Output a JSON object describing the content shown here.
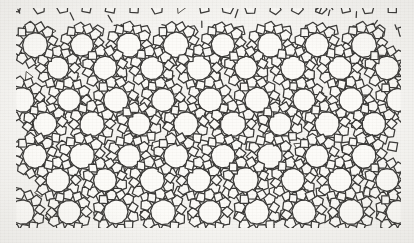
{
  "figure": {
    "title": "",
    "caption": "",
    "domain_label": "framework-tiling-diagram",
    "alt_text": "Periodic-looking network of large circular pores linked by pentagon and square tiles"
  },
  "canvas": {
    "width": 414,
    "height": 243,
    "background_color": "#f6f5f2",
    "paper_tone": "#f2f0ea"
  },
  "pattern_area": {
    "left": 16,
    "top": 8,
    "right": 401,
    "bottom": 228,
    "width": 385,
    "height": 220,
    "margin_top": 8,
    "margin_left": 16,
    "margin_right": 13,
    "margin_bottom": 15
  },
  "style": {
    "stroke_color": "#3b3a38",
    "stroke_color_light": "#56544f",
    "stroke_width": 1.25,
    "stroke_width_thin": 1.0,
    "fill_color": "#fbfaf7",
    "pore_fill": "#fcfbf8"
  },
  "geometry": {
    "lattice_type": "dodecagonal",
    "unit_cell_x": 47.0,
    "unit_cell_y": 46.0,
    "row_offset_x": 23.5,
    "columns": 9,
    "rows": 5,
    "pore_radius_large": 12.4,
    "pore_radius_small": 9.6,
    "pore_sides": 12,
    "ring_pentagon_radius": 6.1,
    "ring_square_half": 4.5,
    "connector_length": 8.4,
    "jitter_amplitude": 0.9,
    "jitter_seed": 20231
  },
  "tile_legend": [
    {
      "name": "twelve-ring-pore",
      "sides": 12,
      "count_approx": 58,
      "role": "large channel opening"
    },
    {
      "name": "pentagon-tile",
      "sides": 5,
      "count_approx": 240,
      "role": "ring linker"
    },
    {
      "name": "square-tile",
      "sides": 4,
      "count_approx": 180,
      "role": "bridge between pores"
    },
    {
      "name": "triangle-node",
      "sides": 3,
      "count_approx": 46,
      "role": "star junction"
    }
  ],
  "pore_grid": {
    "note": "Pore centre coordinates in pattern-area pixel space; r = outer radius.",
    "centers": [
      {
        "x": 35,
        "y": 45,
        "r": 12.6
      },
      {
        "x": 82,
        "y": 45,
        "r": 11.4
      },
      {
        "x": 129,
        "y": 45,
        "r": 12.2
      },
      {
        "x": 176,
        "y": 45,
        "r": 12.8
      },
      {
        "x": 223,
        "y": 45,
        "r": 11.8
      },
      {
        "x": 270,
        "y": 45,
        "r": 12.4
      },
      {
        "x": 317,
        "y": 45,
        "r": 12.0
      },
      {
        "x": 364,
        "y": 45,
        "r": 12.6
      },
      {
        "x": 58,
        "y": 68,
        "r": 11.2
      },
      {
        "x": 105,
        "y": 68,
        "r": 12.0
      },
      {
        "x": 152,
        "y": 68,
        "r": 11.6
      },
      {
        "x": 199,
        "y": 68,
        "r": 12.4
      },
      {
        "x": 246,
        "y": 68,
        "r": 11.4
      },
      {
        "x": 293,
        "y": 68,
        "r": 12.2
      },
      {
        "x": 340,
        "y": 68,
        "r": 11.8
      },
      {
        "x": 387,
        "y": 68,
        "r": 12.0
      },
      {
        "x": 22,
        "y": 100,
        "r": 12.4
      },
      {
        "x": 69,
        "y": 100,
        "r": 11.6
      },
      {
        "x": 116,
        "y": 100,
        "r": 12.6
      },
      {
        "x": 163,
        "y": 100,
        "r": 11.8
      },
      {
        "x": 210,
        "y": 100,
        "r": 12.2
      },
      {
        "x": 257,
        "y": 100,
        "r": 12.6
      },
      {
        "x": 304,
        "y": 100,
        "r": 11.4
      },
      {
        "x": 351,
        "y": 100,
        "r": 12.4
      },
      {
        "x": 398,
        "y": 100,
        "r": 11.8
      },
      {
        "x": 45,
        "y": 124,
        "r": 11.8
      },
      {
        "x": 92,
        "y": 124,
        "r": 12.4
      },
      {
        "x": 139,
        "y": 124,
        "r": 11.4
      },
      {
        "x": 186,
        "y": 124,
        "r": 12.2
      },
      {
        "x": 233,
        "y": 124,
        "r": 12.6
      },
      {
        "x": 280,
        "y": 124,
        "r": 11.6
      },
      {
        "x": 327,
        "y": 124,
        "r": 12.4
      },
      {
        "x": 374,
        "y": 124,
        "r": 12.0
      },
      {
        "x": 35,
        "y": 156,
        "r": 12.2
      },
      {
        "x": 82,
        "y": 156,
        "r": 12.6
      },
      {
        "x": 129,
        "y": 156,
        "r": 11.6
      },
      {
        "x": 176,
        "y": 156,
        "r": 12.4
      },
      {
        "x": 223,
        "y": 156,
        "r": 12.0
      },
      {
        "x": 270,
        "y": 156,
        "r": 12.6
      },
      {
        "x": 317,
        "y": 156,
        "r": 11.8
      },
      {
        "x": 364,
        "y": 156,
        "r": 12.2
      },
      {
        "x": 58,
        "y": 180,
        "r": 12.0
      },
      {
        "x": 105,
        "y": 180,
        "r": 11.6
      },
      {
        "x": 152,
        "y": 180,
        "r": 12.4
      },
      {
        "x": 199,
        "y": 180,
        "r": 12.0
      },
      {
        "x": 246,
        "y": 180,
        "r": 12.6
      },
      {
        "x": 293,
        "y": 180,
        "r": 11.8
      },
      {
        "x": 340,
        "y": 180,
        "r": 12.2
      },
      {
        "x": 387,
        "y": 180,
        "r": 11.6
      },
      {
        "x": 22,
        "y": 212,
        "r": 12.4
      },
      {
        "x": 69,
        "y": 212,
        "r": 11.8
      },
      {
        "x": 116,
        "y": 212,
        "r": 12.2
      },
      {
        "x": 163,
        "y": 212,
        "r": 12.6
      },
      {
        "x": 210,
        "y": 212,
        "r": 11.6
      },
      {
        "x": 257,
        "y": 212,
        "r": 12.4
      },
      {
        "x": 304,
        "y": 212,
        "r": 12.0
      },
      {
        "x": 351,
        "y": 212,
        "r": 12.6
      },
      {
        "x": 398,
        "y": 212,
        "r": 11.8
      }
    ]
  }
}
